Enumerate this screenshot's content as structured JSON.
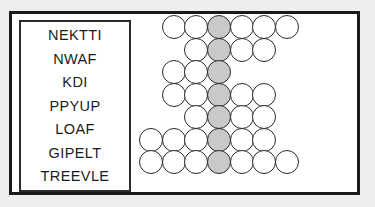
{
  "puzzle": {
    "type": "word-grid-puzzle",
    "colors": {
      "frame_border": "#1a1a1a",
      "box_border": "#2b2b2b",
      "circle_outline": "#2a2a2a",
      "circle_fill": "#ffffff",
      "shaded_circle_fill": "#c9c9c9",
      "page_background": "#eeeeee",
      "text": "#1c1c1c"
    },
    "wordlist": {
      "words": [
        "NEKTTI",
        "NWAF",
        "KDI",
        "PPYUP",
        "LOAF",
        "GIPELT",
        "TREEVLE"
      ]
    },
    "grid": {
      "rows": [
        {
          "word": "NEKTTI",
          "length": 6,
          "shaded_index": 3,
          "left_offset": 1
        },
        {
          "word": "NWAF",
          "length": 4,
          "shaded_index": 2,
          "left_offset": 2
        },
        {
          "word": "KDI",
          "length": 3,
          "shaded_index": 3,
          "left_offset": 0
        },
        {
          "word": "PPYUP",
          "length": 5,
          "shaded_index": 3,
          "left_offset": 0
        },
        {
          "word": "LOAF",
          "length": 4,
          "shaded_index": 2,
          "left_offset": 1
        },
        {
          "word": "GIPELT",
          "length": 6,
          "shaded_index": 4,
          "left_offset": -1
        },
        {
          "word": "TREEVLE",
          "length": 7,
          "shaded_index": 4,
          "left_offset": -1
        }
      ]
    }
  }
}
